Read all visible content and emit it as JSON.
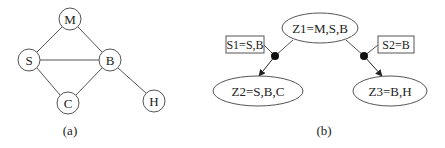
{
  "panel_a": {
    "caption": "(a)",
    "nodes": [
      {
        "id": "M",
        "label": "M"
      },
      {
        "id": "S",
        "label": "S"
      },
      {
        "id": "B",
        "label": "B"
      },
      {
        "id": "C",
        "label": "C"
      },
      {
        "id": "H",
        "label": "H"
      }
    ],
    "edges": [
      [
        "M",
        "S"
      ],
      [
        "M",
        "B"
      ],
      [
        "S",
        "B"
      ],
      [
        "S",
        "C"
      ],
      [
        "C",
        "B"
      ],
      [
        "B",
        "H"
      ]
    ]
  },
  "panel_b": {
    "caption": "(b)",
    "cliques": [
      {
        "id": "Z1",
        "label": "Z1=M,S,B"
      },
      {
        "id": "Z2",
        "label": "Z2=S,B,C"
      },
      {
        "id": "Z3",
        "label": "Z3=B,H"
      }
    ],
    "separators": [
      {
        "id": "S1",
        "label": "S1=S,B",
        "from": "Z1",
        "to": "Z2"
      },
      {
        "id": "S2",
        "label": "S2=B",
        "from": "Z1",
        "to": "Z3"
      }
    ]
  }
}
